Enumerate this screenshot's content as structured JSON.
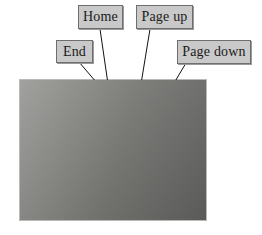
{
  "figure": {
    "kind": "annotated-photograph",
    "background_color": "#ffffff"
  },
  "callouts": [
    {
      "id": "home",
      "label": "Home",
      "points_to": "home-key"
    },
    {
      "id": "pageup",
      "label": "Page up",
      "points_to": "page-up-key"
    },
    {
      "id": "end",
      "label": "End",
      "points_to": "end-key"
    },
    {
      "id": "pagedown",
      "label": "Page down",
      "points_to": "page-down-key"
    }
  ],
  "callout_style": {
    "fill": "#c9c9c9",
    "border": "#6e6e6e",
    "text_color": "#1a1a1a"
  },
  "photo": {
    "palette": {
      "chassis": "#3b3b39",
      "keycap_light": "#d2d2cc",
      "keycap_shadow": "#9b9b95",
      "surface": "#8d8d8a"
    },
    "nav_cluster": {
      "top_row": [
        {
          "label": "Insert",
          "sub": ""
        },
        {
          "label": "Home",
          "sub": ""
        },
        {
          "label": "Page",
          "sub": "Up"
        }
      ],
      "bottom_row": [
        {
          "label": "Delete",
          "sub": ""
        },
        {
          "label": "End",
          "sub": ""
        },
        {
          "label": "Page",
          "sub": "Down"
        }
      ]
    },
    "arrow_keys": {
      "up": "↑",
      "left": "←",
      "down": "↓",
      "right": "→"
    },
    "numpad_column": [
      {
        "label": "/",
        "sub": ""
      },
      {
        "label": "7",
        "sub": "Home"
      },
      {
        "label": "4",
        "sub": ""
      },
      {
        "label": "1",
        "sub": "End"
      },
      {
        "label": "0",
        "sub": "Ins"
      }
    ],
    "main_keys": [
      {
        "label": "←",
        "sub": ""
      },
      {
        "label": "↵",
        "sub": ""
      },
      {
        "label": "Shift",
        "sub": ""
      },
      {
        "label": "Ctrl",
        "sub": ""
      },
      {
        "label": "Alt",
        "sub": ""
      }
    ]
  }
}
